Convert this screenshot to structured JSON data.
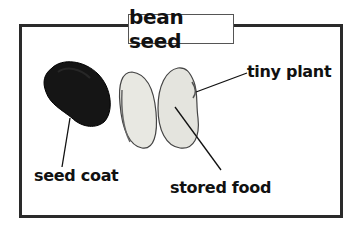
{
  "title": "bean seed",
  "labels": {
    "seed_coat": "seed coat",
    "stored_food": "stored food",
    "tiny_plant": "tiny plant"
  },
  "colors": {
    "frame": "#2a2a2a",
    "seed_coat": "#151515",
    "bean_interior": "#e6e6e0",
    "text": "#111111"
  }
}
